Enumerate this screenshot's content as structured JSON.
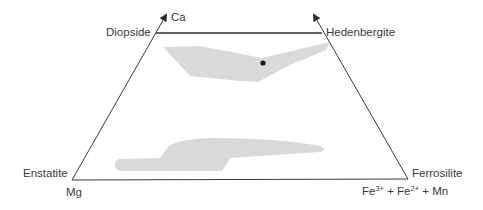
{
  "diagram": {
    "type": "pyroxene quadrilateral",
    "colors": {
      "line": "#3a3a3a",
      "field_fill": "#d9d9d9",
      "point": "#1a1a1a",
      "text": "#3a3a3a"
    },
    "apex_labels": {
      "ca": "Ca",
      "mg": "Mg",
      "fe_part1": "Fe",
      "fe_sup1": "3+",
      "fe_part2": " + Fe",
      "fe_sup2": "2+",
      "fe_part3": " + Mn"
    },
    "end_members": {
      "top_left": "Diopside",
      "top_right": "Hedenbergite",
      "bottom_left": "Enstatite",
      "bottom_right": "Ferrosilite"
    },
    "fields": [
      {
        "name": "upper-composition-field",
        "description": "chevron-shaped shaded field below Di-Hd join"
      },
      {
        "name": "lower-composition-field",
        "description": "stepped shaded field above En-Fs join"
      }
    ],
    "points": [
      {
        "name": "composition-point",
        "x": 263,
        "y": 63
      }
    ]
  }
}
